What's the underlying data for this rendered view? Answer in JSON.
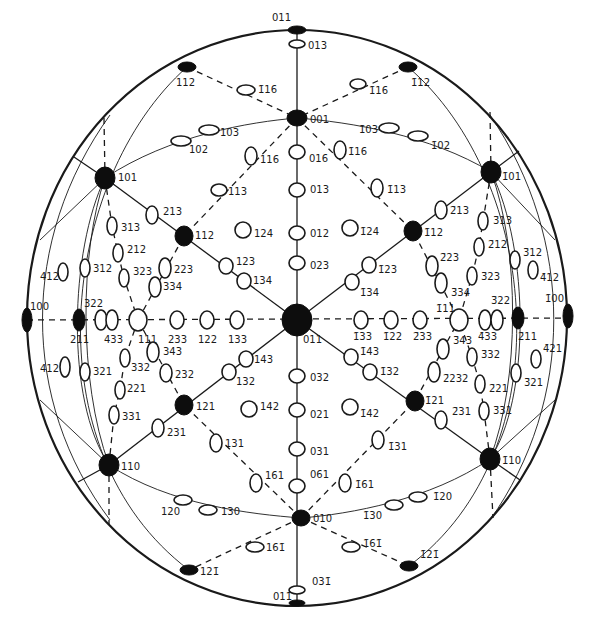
{
  "figure": {
    "type": "stereographic projection",
    "center_pole": "011",
    "primitive_circle": {
      "cx": 297,
      "cy": 318,
      "rx": 270,
      "ry": 288
    }
  },
  "poles": [
    {
      "id": "p011top",
      "label": "011",
      "x": 297,
      "y": 30,
      "kind": "filled",
      "rx": 9,
      "ry": 4,
      "lx": 272,
      "ly": 21
    },
    {
      "id": "p013",
      "label": "013",
      "x": 297,
      "y": 44,
      "kind": "open",
      "rx": 8,
      "ry": 4,
      "lx": 308,
      "ly": 49
    },
    {
      "id": "p112a",
      "label": "112",
      "x": 187,
      "y": 67,
      "kind": "filled",
      "rx": 9,
      "ry": 5,
      "lx": 176,
      "ly": 86
    },
    {
      "id": "p116a",
      "label": "1̄16",
      "x": 246,
      "y": 90,
      "kind": "open",
      "rx": 9,
      "ry": 5,
      "lx": 258,
      "ly": 93
    },
    {
      "id": "pm112a",
      "label": "1̄12",
      "x": 408,
      "y": 67,
      "kind": "filled",
      "rx": 9,
      "ry": 5,
      "lx": 411,
      "ly": 86
    },
    {
      "id": "pm116a",
      "label": "1̄16",
      "x": 358,
      "y": 84,
      "kind": "open",
      "rx": 8,
      "ry": 5,
      "lx": 369,
      "ly": 94
    },
    {
      "id": "p001",
      "label": "001",
      "x": 297,
      "y": 118,
      "kind": "filled",
      "rx": 10,
      "ry": 8,
      "lx": 310,
      "ly": 123
    },
    {
      "id": "p103",
      "label": "103",
      "x": 209,
      "y": 130,
      "kind": "open",
      "rx": 10,
      "ry": 5,
      "lx": 220,
      "ly": 136
    },
    {
      "id": "p102",
      "label": "102",
      "x": 181,
      "y": 141,
      "kind": "open",
      "rx": 10,
      "ry": 5,
      "lx": 189,
      "ly": 153
    },
    {
      "id": "pm103",
      "label": "1̄03",
      "x": 389,
      "y": 128,
      "kind": "open",
      "rx": 10,
      "ry": 5,
      "lx": 359,
      "ly": 133
    },
    {
      "id": "pm102",
      "label": "1̄02",
      "x": 418,
      "y": 136,
      "kind": "open",
      "rx": 10,
      "ry": 5,
      "lx": 431,
      "ly": 149
    },
    {
      "id": "p116b",
      "label": "116",
      "x": 251,
      "y": 156,
      "kind": "open",
      "rx": 6,
      "ry": 9,
      "lx": 260,
      "ly": 163
    },
    {
      "id": "p016",
      "label": "016",
      "x": 297,
      "y": 152,
      "kind": "open",
      "rx": 8,
      "ry": 7,
      "lx": 309,
      "ly": 162
    },
    {
      "id": "pm116b",
      "label": "1̄16",
      "x": 340,
      "y": 150,
      "kind": "open",
      "rx": 6,
      "ry": 9,
      "lx": 348,
      "ly": 155
    },
    {
      "id": "p101",
      "label": "101",
      "x": 105,
      "y": 178,
      "kind": "filled",
      "rx": 10,
      "ry": 11,
      "lx": 118,
      "ly": 181
    },
    {
      "id": "pm101",
      "label": "1̄01",
      "x": 491,
      "y": 172,
      "kind": "filled",
      "rx": 10,
      "ry": 11,
      "lx": 502,
      "ly": 180
    },
    {
      "id": "p113",
      "label": "113",
      "x": 219,
      "y": 190,
      "kind": "open",
      "rx": 8,
      "ry": 6,
      "lx": 228,
      "ly": 195
    },
    {
      "id": "p013b",
      "label": "013",
      "x": 297,
      "y": 190,
      "kind": "open",
      "rx": 8,
      "ry": 7,
      "lx": 310,
      "ly": 193
    },
    {
      "id": "pm113",
      "label": "1̄13",
      "x": 377,
      "y": 188,
      "kind": "open",
      "rx": 6,
      "ry": 9,
      "lx": 387,
      "ly": 193
    },
    {
      "id": "p213",
      "label": "213",
      "x": 152,
      "y": 215,
      "kind": "open",
      "rx": 6,
      "ry": 9,
      "lx": 163,
      "ly": 215
    },
    {
      "id": "pm213",
      "label": "2̄13",
      "x": 441,
      "y": 210,
      "kind": "open",
      "rx": 6,
      "ry": 9,
      "lx": 450,
      "ly": 214
    },
    {
      "id": "p313",
      "label": "313",
      "x": 112,
      "y": 226,
      "kind": "open",
      "rx": 5,
      "ry": 9,
      "lx": 121,
      "ly": 231
    },
    {
      "id": "pm313",
      "label": "3̄13",
      "x": 483,
      "y": 221,
      "kind": "open",
      "rx": 5,
      "ry": 9,
      "lx": 493,
      "ly": 224
    },
    {
      "id": "p112",
      "label": "112",
      "x": 184,
      "y": 236,
      "kind": "filled",
      "rx": 9,
      "ry": 10,
      "lx": 195,
      "ly": 239
    },
    {
      "id": "p124",
      "label": "124",
      "x": 243,
      "y": 230,
      "kind": "open",
      "rx": 8,
      "ry": 8,
      "lx": 254,
      "ly": 237
    },
    {
      "id": "p012",
      "label": "012",
      "x": 297,
      "y": 233,
      "kind": "open",
      "rx": 8,
      "ry": 7,
      "lx": 310,
      "ly": 237
    },
    {
      "id": "pm124",
      "label": "1̄24",
      "x": 350,
      "y": 228,
      "kind": "open",
      "rx": 8,
      "ry": 8,
      "lx": 360,
      "ly": 235
    },
    {
      "id": "pm112",
      "label": "1̄12",
      "x": 413,
      "y": 231,
      "kind": "filled",
      "rx": 9,
      "ry": 10,
      "lx": 424,
      "ly": 236
    },
    {
      "id": "p212",
      "label": "212",
      "x": 118,
      "y": 253,
      "kind": "open",
      "rx": 5,
      "ry": 9,
      "lx": 127,
      "ly": 253
    },
    {
      "id": "pm212",
      "label": "2̄12",
      "x": 479,
      "y": 247,
      "kind": "open",
      "rx": 5,
      "ry": 9,
      "lx": 488,
      "ly": 248
    },
    {
      "id": "p412",
      "label": "412",
      "x": 63,
      "y": 272,
      "kind": "open",
      "rx": 5,
      "ry": 9,
      "lx": 40,
      "ly": 280
    },
    {
      "id": "p312",
      "label": "312",
      "x": 85,
      "y": 268,
      "kind": "open",
      "rx": 5,
      "ry": 9,
      "lx": 93,
      "ly": 272
    },
    {
      "id": "p323",
      "label": "323",
      "x": 124,
      "y": 278,
      "kind": "open",
      "rx": 5,
      "ry": 9,
      "lx": 133,
      "ly": 275
    },
    {
      "id": "p223",
      "label": "223",
      "x": 165,
      "y": 268,
      "kind": "open",
      "rx": 6,
      "ry": 10,
      "lx": 174,
      "ly": 273
    },
    {
      "id": "p123",
      "label": "123",
      "x": 226,
      "y": 266,
      "kind": "open",
      "rx": 7,
      "ry": 8,
      "lx": 236,
      "ly": 265
    },
    {
      "id": "p023",
      "label": "023",
      "x": 297,
      "y": 263,
      "kind": "open",
      "rx": 8,
      "ry": 7,
      "lx": 310,
      "ly": 269
    },
    {
      "id": "pm123",
      "label": "1̄23",
      "x": 369,
      "y": 265,
      "kind": "open",
      "rx": 7,
      "ry": 8,
      "lx": 378,
      "ly": 273
    },
    {
      "id": "pm223",
      "label": "2̄23",
      "x": 432,
      "y": 266,
      "kind": "open",
      "rx": 6,
      "ry": 10,
      "lx": 440,
      "ly": 261
    },
    {
      "id": "pm323",
      "label": "3̄23",
      "x": 472,
      "y": 276,
      "kind": "open",
      "rx": 5,
      "ry": 9,
      "lx": 481,
      "ly": 280
    },
    {
      "id": "pm312",
      "label": "3̄12",
      "x": 515,
      "y": 260,
      "kind": "open",
      "rx": 5,
      "ry": 9,
      "lx": 523,
      "ly": 256
    },
    {
      "id": "pm412",
      "label": "4̄12",
      "x": 533,
      "y": 270,
      "kind": "open",
      "rx": 5,
      "ry": 9,
      "lx": 540,
      "ly": 281
    },
    {
      "id": "p334",
      "label": "334",
      "x": 155,
      "y": 287,
      "kind": "open",
      "rx": 6,
      "ry": 10,
      "lx": 163,
      "ly": 290
    },
    {
      "id": "p134",
      "label": "134",
      "x": 244,
      "y": 281,
      "kind": "open",
      "rx": 7,
      "ry": 8,
      "lx": 253,
      "ly": 284
    },
    {
      "id": "pm134",
      "label": "1̄34",
      "x": 352,
      "y": 282,
      "kind": "open",
      "rx": 7,
      "ry": 8,
      "lx": 360,
      "ly": 296
    },
    {
      "id": "pm334",
      "label": "3̄34",
      "x": 441,
      "y": 283,
      "kind": "open",
      "rx": 6,
      "ry": 10,
      "lx": 451,
      "ly": 296
    },
    {
      "id": "p100",
      "label": "100",
      "x": 27,
      "y": 320,
      "kind": "filled",
      "rx": 5,
      "ry": 12,
      "lx": 30,
      "ly": 310
    },
    {
      "id": "p211",
      "label": "211",
      "x": 79,
      "y": 320,
      "kind": "filled",
      "rx": 6,
      "ry": 11,
      "lx": 70,
      "ly": 343
    },
    {
      "id": "p322",
      "label": "322",
      "x": 101,
      "y": 320,
      "kind": "open",
      "rx": 6,
      "ry": 10,
      "lx": 84,
      "ly": 307
    },
    {
      "id": "p433",
      "label": "433",
      "x": 112,
      "y": 320,
      "kind": "open",
      "rx": 6,
      "ry": 10,
      "lx": 104,
      "ly": 343
    },
    {
      "id": "p111",
      "label": "111",
      "x": 138,
      "y": 320,
      "kind": "open",
      "rx": 9,
      "ry": 11,
      "lx": 138,
      "ly": 343
    },
    {
      "id": "p233",
      "label": "233",
      "x": 177,
      "y": 320,
      "kind": "open",
      "rx": 7,
      "ry": 9,
      "lx": 168,
      "ly": 343
    },
    {
      "id": "p122",
      "label": "122",
      "x": 207,
      "y": 320,
      "kind": "open",
      "rx": 7,
      "ry": 9,
      "lx": 198,
      "ly": 343
    },
    {
      "id": "p133",
      "label": "133",
      "x": 237,
      "y": 320,
      "kind": "open",
      "rx": 7,
      "ry": 9,
      "lx": 228,
      "ly": 343
    },
    {
      "id": "p011",
      "label": "011",
      "x": 297,
      "y": 320,
      "kind": "filled",
      "rx": 15,
      "ry": 16,
      "lx": 303,
      "ly": 343
    },
    {
      "id": "pm133",
      "label": "1̄33",
      "x": 361,
      "y": 320,
      "kind": "open",
      "rx": 7,
      "ry": 9,
      "lx": 353,
      "ly": 340
    },
    {
      "id": "pm122",
      "label": "1̄22",
      "x": 391,
      "y": 320,
      "kind": "open",
      "rx": 7,
      "ry": 9,
      "lx": 383,
      "ly": 340
    },
    {
      "id": "pm233",
      "label": "2̄33",
      "x": 420,
      "y": 320,
      "kind": "open",
      "rx": 7,
      "ry": 9,
      "lx": 413,
      "ly": 340
    },
    {
      "id": "pm111",
      "label": "1̄11",
      "x": 459,
      "y": 320,
      "kind": "open",
      "rx": 9,
      "ry": 11,
      "lx": 436,
      "ly": 312
    },
    {
      "id": "pm433",
      "label": "4̄33",
      "x": 485,
      "y": 320,
      "kind": "open",
      "rx": 6,
      "ry": 10,
      "lx": 478,
      "ly": 340
    },
    {
      "id": "pm322",
      "label": "3̄22",
      "x": 497,
      "y": 320,
      "kind": "open",
      "rx": 6,
      "ry": 10,
      "lx": 491,
      "ly": 304
    },
    {
      "id": "pm211",
      "label": "2̄11",
      "x": 518,
      "y": 318,
      "kind": "filled",
      "rx": 6,
      "ry": 11,
      "lx": 518,
      "ly": 340
    },
    {
      "id": "pm100",
      "label": "1̄00",
      "x": 568,
      "y": 316,
      "kind": "filled",
      "rx": 5,
      "ry": 12,
      "lx": 545,
      "ly": 302
    },
    {
      "id": "p343",
      "label": "343",
      "x": 153,
      "y": 352,
      "kind": "open",
      "rx": 6,
      "ry": 10,
      "lx": 163,
      "ly": 355
    },
    {
      "id": "p332",
      "label": "332",
      "x": 125,
      "y": 358,
      "kind": "open",
      "rx": 5,
      "ry": 9,
      "lx": 131,
      "ly": 371
    },
    {
      "id": "p143",
      "label": "143",
      "x": 246,
      "y": 359,
      "kind": "open",
      "rx": 7,
      "ry": 8,
      "lx": 254,
      "ly": 363
    },
    {
      "id": "pm143",
      "label": "1̄43",
      "x": 351,
      "y": 357,
      "kind": "open",
      "rx": 7,
      "ry": 8,
      "lx": 360,
      "ly": 355
    },
    {
      "id": "pm343",
      "label": "3̄43",
      "x": 443,
      "y": 349,
      "kind": "open",
      "rx": 6,
      "ry": 10,
      "lx": 453,
      "ly": 344
    },
    {
      "id": "pm332",
      "label": "3̄32",
      "x": 472,
      "y": 357,
      "kind": "open",
      "rx": 5,
      "ry": 9,
      "lx": 481,
      "ly": 358
    },
    {
      "id": "pm421",
      "label": "4̄21",
      "x": 536,
      "y": 359,
      "kind": "open",
      "rx": 5,
      "ry": 9,
      "lx": 543,
      "ly": 352
    },
    {
      "id": "p412b",
      "label": "412",
      "x": 65,
      "y": 367,
      "kind": "open",
      "rx": 5,
      "ry": 10,
      "lx": 40,
      "ly": 372
    },
    {
      "id": "p321",
      "label": "321",
      "x": 85,
      "y": 372,
      "kind": "open",
      "rx": 5,
      "ry": 9,
      "lx": 93,
      "ly": 375
    },
    {
      "id": "p232",
      "label": "232",
      "x": 166,
      "y": 373,
      "kind": "open",
      "rx": 6,
      "ry": 9,
      "lx": 175,
      "ly": 378
    },
    {
      "id": "p132",
      "label": "132",
      "x": 229,
      "y": 372,
      "kind": "open",
      "rx": 7,
      "ry": 8,
      "lx": 236,
      "ly": 385
    },
    {
      "id": "p032",
      "label": "032",
      "x": 297,
      "y": 376,
      "kind": "open",
      "rx": 8,
      "ry": 7,
      "lx": 310,
      "ly": 381
    },
    {
      "id": "pm132",
      "label": "1̄32",
      "x": 370,
      "y": 372,
      "kind": "open",
      "rx": 7,
      "ry": 8,
      "lx": 380,
      "ly": 375
    },
    {
      "id": "pm232",
      "label": "2̄232",
      "x": 434,
      "y": 372,
      "kind": "open",
      "rx": 6,
      "ry": 10,
      "lx": 443,
      "ly": 382
    },
    {
      "id": "pm321",
      "label": "3̄21",
      "x": 516,
      "y": 373,
      "kind": "open",
      "rx": 5,
      "ry": 9,
      "lx": 524,
      "ly": 386
    },
    {
      "id": "p221",
      "label": "221",
      "x": 120,
      "y": 390,
      "kind": "open",
      "rx": 5,
      "ry": 9,
      "lx": 127,
      "ly": 392
    },
    {
      "id": "pm221",
      "label": "2̄21",
      "x": 480,
      "y": 384,
      "kind": "open",
      "rx": 5,
      "ry": 9,
      "lx": 489,
      "ly": 392
    },
    {
      "id": "p121",
      "label": "121",
      "x": 184,
      "y": 405,
      "kind": "filled",
      "rx": 9,
      "ry": 10,
      "lx": 196,
      "ly": 410
    },
    {
      "id": "p142",
      "label": "142",
      "x": 249,
      "y": 409,
      "kind": "open",
      "rx": 8,
      "ry": 8,
      "lx": 260,
      "ly": 410
    },
    {
      "id": "p021",
      "label": "021",
      "x": 297,
      "y": 410,
      "kind": "open",
      "rx": 8,
      "ry": 7,
      "lx": 310,
      "ly": 418
    },
    {
      "id": "pm142",
      "label": "1̄42",
      "x": 350,
      "y": 407,
      "kind": "open",
      "rx": 8,
      "ry": 8,
      "lx": 360,
      "ly": 417
    },
    {
      "id": "pm121",
      "label": "1̄21",
      "x": 415,
      "y": 401,
      "kind": "filled",
      "rx": 9,
      "ry": 10,
      "lx": 425,
      "ly": 404
    },
    {
      "id": "p331",
      "label": "331",
      "x": 114,
      "y": 415,
      "kind": "open",
      "rx": 5,
      "ry": 9,
      "lx": 122,
      "ly": 420
    },
    {
      "id": "pm331",
      "label": "3̄31",
      "x": 484,
      "y": 411,
      "kind": "open",
      "rx": 5,
      "ry": 9,
      "lx": 493,
      "ly": 414
    },
    {
      "id": "p231",
      "label": "231",
      "x": 158,
      "y": 428,
      "kind": "open",
      "rx": 6,
      "ry": 9,
      "lx": 167,
      "ly": 436
    },
    {
      "id": "pm231",
      "label": "2̄31",
      "x": 441,
      "y": 420,
      "kind": "open",
      "rx": 6,
      "ry": 9,
      "lx": 452,
      "ly": 415
    },
    {
      "id": "p131",
      "label": "131",
      "x": 216,
      "y": 443,
      "kind": "open",
      "rx": 6,
      "ry": 9,
      "lx": 225,
      "ly": 447
    },
    {
      "id": "p031",
      "label": "031",
      "x": 297,
      "y": 449,
      "kind": "open",
      "rx": 8,
      "ry": 7,
      "lx": 310,
      "ly": 455
    },
    {
      "id": "pm131",
      "label": "1̄31",
      "x": 378,
      "y": 440,
      "kind": "open",
      "rx": 6,
      "ry": 9,
      "lx": 388,
      "ly": 450
    },
    {
      "id": "p110",
      "label": "110",
      "x": 109,
      "y": 465,
      "kind": "filled",
      "rx": 10,
      "ry": 11,
      "lx": 121,
      "ly": 470
    },
    {
      "id": "pm110",
      "label": "1̄10",
      "x": 490,
      "y": 459,
      "kind": "filled",
      "rx": 10,
      "ry": 11,
      "lx": 502,
      "ly": 464
    },
    {
      "id": "p161",
      "label": "161",
      "x": 256,
      "y": 483,
      "kind": "open",
      "rx": 6,
      "ry": 9,
      "lx": 265,
      "ly": 479
    },
    {
      "id": "p061",
      "label": "061",
      "x": 297,
      "y": 486,
      "kind": "open",
      "rx": 8,
      "ry": 7,
      "lx": 310,
      "ly": 478
    },
    {
      "id": "pm161",
      "label": "1̄61",
      "x": 345,
      "y": 483,
      "kind": "open",
      "rx": 6,
      "ry": 9,
      "lx": 355,
      "ly": 488
    },
    {
      "id": "p120",
      "label": "120",
      "x": 183,
      "y": 500,
      "kind": "open",
      "rx": 9,
      "ry": 5,
      "lx": 161,
      "ly": 515
    },
    {
      "id": "p130",
      "label": "130",
      "x": 208,
      "y": 510,
      "kind": "open",
      "rx": 9,
      "ry": 5,
      "lx": 221,
      "ly": 515
    },
    {
      "id": "pm130",
      "label": "1̄30",
      "x": 394,
      "y": 505,
      "kind": "open",
      "rx": 9,
      "ry": 5,
      "lx": 363,
      "ly": 519
    },
    {
      "id": "pm120",
      "label": "1̄20",
      "x": 418,
      "y": 497,
      "kind": "open",
      "rx": 9,
      "ry": 5,
      "lx": 433,
      "ly": 500
    },
    {
      "id": "p010",
      "label": "010",
      "x": 301,
      "y": 518,
      "kind": "filled",
      "rx": 9,
      "ry": 8,
      "lx": 313,
      "ly": 522
    },
    {
      "id": "p16m1",
      "label": "161̄",
      "x": 255,
      "y": 547,
      "kind": "open",
      "rx": 9,
      "ry": 5,
      "lx": 266,
      "ly": 551
    },
    {
      "id": "pm16m1",
      "label": "1̄61̄",
      "x": 351,
      "y": 547,
      "kind": "open",
      "rx": 9,
      "ry": 5,
      "lx": 363,
      "ly": 547
    },
    {
      "id": "p12m1",
      "label": "121̄",
      "x": 189,
      "y": 570,
      "kind": "filled",
      "rx": 9,
      "ry": 5,
      "lx": 200,
      "ly": 575
    },
    {
      "id": "pm12m1",
      "label": "1̄21̄",
      "x": 409,
      "y": 566,
      "kind": "filled",
      "rx": 9,
      "ry": 5,
      "lx": 420,
      "ly": 558
    },
    {
      "id": "p03m1",
      "label": "031̄",
      "x": 297,
      "y": 590,
      "kind": "open",
      "rx": 8,
      "ry": 4,
      "lx": 312,
      "ly": 585
    },
    {
      "id": "p01m1",
      "label": "011̄",
      "x": 297,
      "y": 603,
      "kind": "filled",
      "rx": 8,
      "ry": 3,
      "lx": 273,
      "ly": 600
    }
  ]
}
